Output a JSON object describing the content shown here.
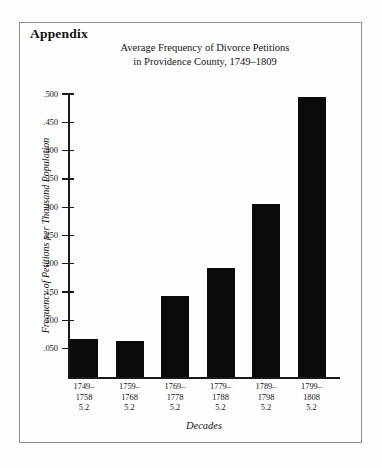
{
  "page": {
    "appendix_heading": "Appendix"
  },
  "chart_data": {
    "type": "bar",
    "title": "Average Frequency of Divorce Petitions",
    "subtitle": "in Providence County, 1749–1809",
    "xlabel": "Decades",
    "ylabel": "Frequency of Petitions per Thousand Population",
    "categories": [
      "1749–1758",
      "1759–1768",
      "1769–1778",
      "1779–1788",
      "1789–1798",
      "1799–1808"
    ],
    "category_lines": [
      [
        "1749–",
        "1758",
        "5.2"
      ],
      [
        "1759–",
        "1768",
        "5.2"
      ],
      [
        "1769–",
        "1778",
        "5.2"
      ],
      [
        "1779–",
        "1788",
        "5.2"
      ],
      [
        "1789–",
        "1798",
        "5.2"
      ],
      [
        "1799–",
        "1808",
        "5.2"
      ]
    ],
    "secondary_row_values": [
      "5.2",
      "5.2",
      "5.2",
      "5.2",
      "5.2",
      "5.2"
    ],
    "values": [
      0.068,
      0.063,
      0.143,
      0.192,
      0.305,
      0.495
    ],
    "ylim": [
      0.0,
      0.5
    ],
    "ytick_values": [
      0.5,
      0.45,
      0.4,
      0.35,
      0.3,
      0.25,
      0.2,
      0.15,
      0.1,
      0.05
    ],
    "ytick_labels": [
      ".500",
      ".450",
      ".400",
      ".350",
      ".300",
      ".250",
      ".200",
      ".150",
      ".100",
      ".050"
    ],
    "grid": false,
    "legend": false,
    "bar_color": "#0a0a0a",
    "axis_color": "#1a1a1a",
    "frame_color": "#8e8e8e"
  }
}
